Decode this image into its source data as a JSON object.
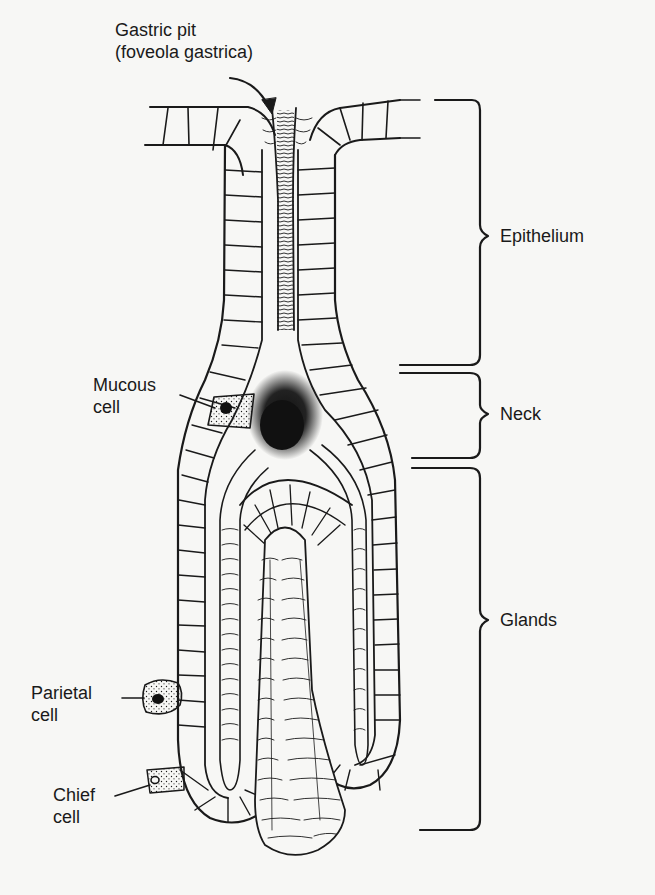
{
  "diagram": {
    "colors": {
      "background": "#f7f7f5",
      "ink": "#1a1a1a"
    },
    "labels": {
      "gastric_pit_line1": "Gastric pit",
      "gastric_pit_line2": "(foveola gastrica)",
      "mucous_cell_line1": "Mucous",
      "mucous_cell_line2": "cell",
      "parietal_cell_line1": "Parietal",
      "parietal_cell_line2": "cell",
      "chief_cell_line1": "Chief",
      "chief_cell_line2": "cell"
    },
    "regions": [
      {
        "name": "Epithelium",
        "bracket_top_px": 100,
        "bracket_bottom_px": 365
      },
      {
        "name": "Neck",
        "bracket_top_px": 373,
        "bracket_bottom_px": 458
      },
      {
        "name": "Glands",
        "bracket_top_px": 468,
        "bracket_bottom_px": 830
      }
    ]
  }
}
